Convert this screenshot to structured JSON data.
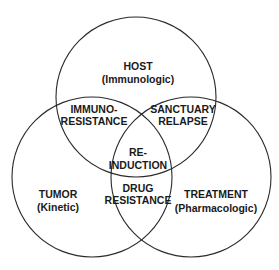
{
  "diagram": {
    "type": "venn",
    "sets": [
      {
        "id": "host",
        "title": "HOST",
        "subtitle": "(Immunologic)"
      },
      {
        "id": "tumor",
        "title": "TUMOR",
        "subtitle": "(Kinetic)"
      },
      {
        "id": "treatment",
        "title": "TREATMENT",
        "subtitle": "(Pharmacologic)"
      }
    ],
    "intersections": [
      {
        "id": "host-tumor",
        "sets": [
          "host",
          "tumor"
        ],
        "line1": "IMMUNO-",
        "line2": "RESISTANCE"
      },
      {
        "id": "host-treatment",
        "sets": [
          "host",
          "treatment"
        ],
        "line1": "SANCTUARY",
        "line2": "RELAPSE"
      },
      {
        "id": "all",
        "sets": [
          "host",
          "tumor",
          "treatment"
        ],
        "line1": "RE-",
        "line2": "INDUCTION"
      },
      {
        "id": "tumor-treatment",
        "sets": [
          "tumor",
          "treatment"
        ],
        "line1": "DRUG",
        "line2": "RESISTANCE"
      }
    ],
    "colors": {
      "stroke": "#2a2a2a",
      "text": "#1a1a1a",
      "background": "#ffffff"
    }
  }
}
